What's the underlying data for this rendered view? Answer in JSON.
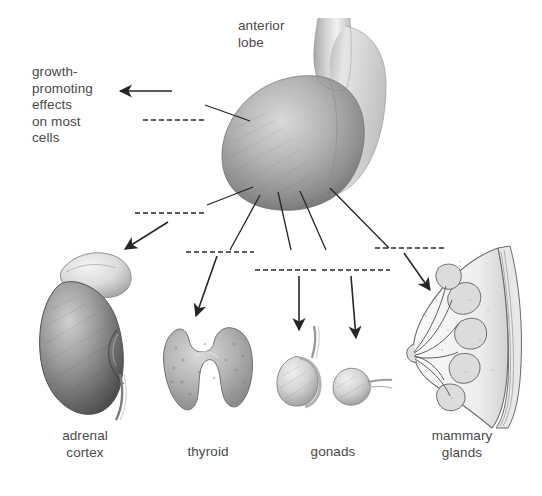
{
  "figure": {
    "background_color": "#ffffff",
    "ink_color": "#3a3a3a",
    "text_color": "#4a4a4a"
  },
  "labels": {
    "anterior_lobe": "anterior\nlobe",
    "growth_effects": "growth-\npromoting\neffects\non most\ncells",
    "adrenal_cortex": "adrenal\ncortex",
    "thyroid": "thyroid",
    "gonads": "gonads",
    "mammary_glands": "mammary\nglands"
  },
  "blank_lines": [
    {
      "name": "blank-growth-hormone",
      "x": 143,
      "y": 120,
      "width": 62
    },
    {
      "name": "blank-adrenal-hormone",
      "x": 135,
      "y": 213,
      "width": 70
    },
    {
      "name": "blank-thyroid-hormone",
      "x": 186,
      "y": 252,
      "width": 68
    },
    {
      "name": "blank-gonad-hormone-1",
      "x": 255,
      "y": 270,
      "width": 62
    },
    {
      "name": "blank-gonad-hormone-2",
      "x": 322,
      "y": 270,
      "width": 68
    },
    {
      "name": "blank-mammary-hormone",
      "x": 375,
      "y": 248,
      "width": 72
    }
  ],
  "organs": [
    {
      "name": "pituitary-gland",
      "label": "anterior lobe"
    },
    {
      "name": "adrenal-gland-kidney",
      "label": "adrenal cortex"
    },
    {
      "name": "thyroid-gland",
      "label": "thyroid"
    },
    {
      "name": "gonads-testis-ovary",
      "label": "gonads"
    },
    {
      "name": "mammary-gland-cross-section",
      "label": "mammary glands"
    }
  ],
  "arrows": [
    {
      "name": "arrow-to-growth-effects",
      "target": "growth-promoting effects on most cells"
    },
    {
      "name": "arrow-to-adrenal",
      "target": "adrenal cortex"
    },
    {
      "name": "arrow-to-thyroid",
      "target": "thyroid"
    },
    {
      "name": "arrow-to-testis",
      "target": "gonads"
    },
    {
      "name": "arrow-to-ovary",
      "target": "gonads"
    },
    {
      "name": "arrow-to-mammary",
      "target": "mammary glands"
    }
  ]
}
